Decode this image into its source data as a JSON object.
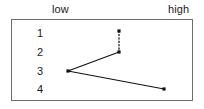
{
  "figure": {
    "width": 204,
    "height": 109,
    "background_color": "#ffffff",
    "border_color": "#6e6e6e",
    "ink_color": "#111111"
  },
  "axis": {
    "low_label": "low",
    "high_label": "high"
  },
  "rows": [
    {
      "label": "1",
      "y": 32
    },
    {
      "label": "2",
      "y": 51
    },
    {
      "label": "3",
      "y": 70
    },
    {
      "label": "4",
      "y": 88
    }
  ],
  "chart_data": {
    "type": "line",
    "title": "",
    "xlabel": "",
    "ylabel": "",
    "xlim": [
      0,
      1
    ],
    "x_tick_labels": [
      "low",
      "high"
    ],
    "ylim": [
      1,
      4
    ],
    "y_tick_labels": [
      "1",
      "2",
      "3",
      "4"
    ],
    "y_inverted": true,
    "grid": false,
    "legend": "none",
    "points": [
      {
        "name": "p1",
        "row": 1,
        "x_fraction": 0.588,
        "px": 118,
        "py": 30
      },
      {
        "name": "p2",
        "row": 2,
        "x_fraction": 0.588,
        "px": 118,
        "py": 51
      },
      {
        "name": "p3",
        "row": 3,
        "x_fraction": 0.308,
        "px": 67,
        "py": 70
      },
      {
        "name": "p4",
        "row": 4,
        "x_fraction": 0.835,
        "px": 163,
        "py": 88
      }
    ],
    "segments": [
      {
        "name": "p1-p2",
        "from": "p1",
        "to": "p2",
        "style": "dotted"
      },
      {
        "name": "p2-p3",
        "from": "p2",
        "to": "p3",
        "style": "solid"
      },
      {
        "name": "p3-p4",
        "from": "p3",
        "to": "p4",
        "style": "solid"
      }
    ]
  }
}
